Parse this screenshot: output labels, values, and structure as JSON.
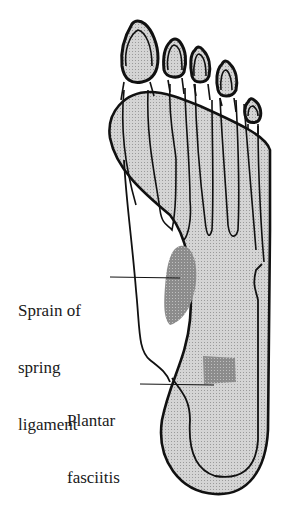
{
  "diagram": {
    "labels": [
      {
        "id": "sprain",
        "lines": [
          "Sprain of",
          "spring",
          "ligament"
        ]
      },
      {
        "id": "plantar",
        "lines": [
          "Plantar",
          "fasciitis"
        ]
      }
    ],
    "colors": {
      "outline": "#111111",
      "fascia_fill": "#c8c8c8",
      "lesion_fill": "#8a8a8a",
      "background": "#ffffff"
    }
  }
}
